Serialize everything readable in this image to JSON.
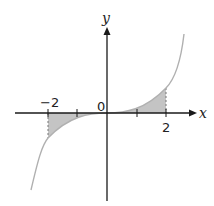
{
  "diagram": {
    "type": "function-graph",
    "axes": {
      "x_label": "x",
      "y_label": "y",
      "origin_label": "0"
    },
    "ticks": {
      "x": [
        {
          "value": -2,
          "label": "−2"
        },
        {
          "value": -1,
          "label": ""
        },
        {
          "value": 1,
          "label": ""
        },
        {
          "value": 2,
          "label": "2"
        }
      ]
    },
    "shaded_regions": [
      {
        "from": -2,
        "to": 0,
        "side": "below x-axis"
      },
      {
        "from": 0,
        "to": 2,
        "side": "above x-axis"
      }
    ],
    "colors": {
      "axis": "#1a1a1a",
      "curve": "#b0b0b0",
      "shade": "#c4c4c4",
      "dashed": "#777777"
    }
  }
}
